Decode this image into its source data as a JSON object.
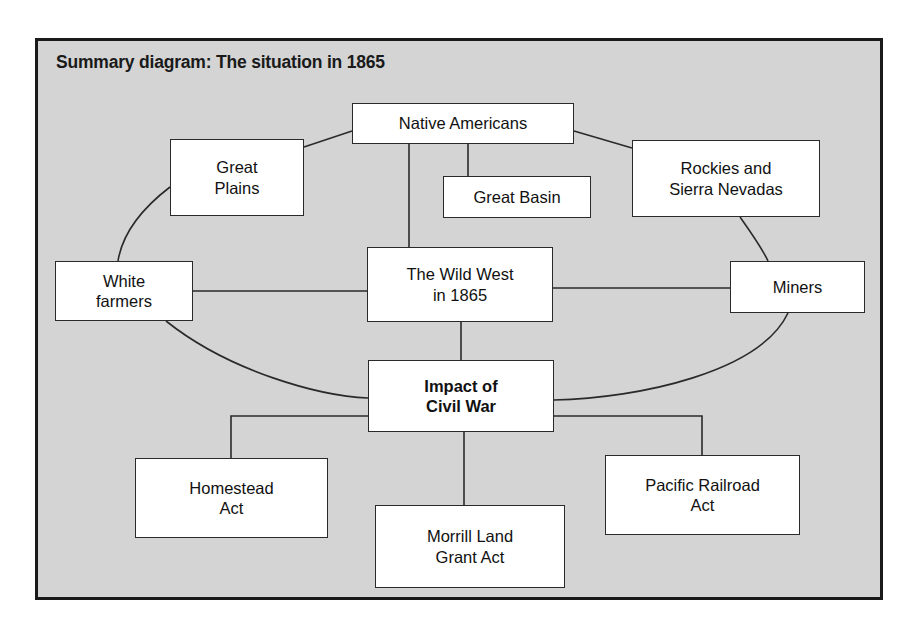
{
  "diagram": {
    "title": "Summary diagram: The situation in 1865",
    "type": "concept-map",
    "frame": {
      "background_color": "#d4d4d4",
      "border_color": "#1a1a1a",
      "page_background": "#ffffff"
    },
    "node_style": {
      "fill": "#ffffff",
      "stroke": "#2a2a2a",
      "text_color": "#111111"
    },
    "nodes": [
      {
        "id": "native-americans",
        "label": "Native Americans",
        "bold": false,
        "x": 352,
        "y": 103,
        "w": 222,
        "h": 41
      },
      {
        "id": "great-plains",
        "label": "Great\nPlains",
        "bold": false,
        "x": 170,
        "y": 139,
        "w": 134,
        "h": 77
      },
      {
        "id": "great-basin",
        "label": "Great Basin",
        "bold": false,
        "x": 443,
        "y": 176,
        "w": 148,
        "h": 42
      },
      {
        "id": "rockies-sierra-nevadas",
        "label": "Rockies and\nSierra Nevadas",
        "bold": false,
        "x": 632,
        "y": 140,
        "w": 188,
        "h": 77
      },
      {
        "id": "white-farmers",
        "label": "White\nfarmers",
        "bold": false,
        "x": 55,
        "y": 261,
        "w": 138,
        "h": 60
      },
      {
        "id": "wild-west-1865",
        "label": "The Wild West\nin 1865",
        "bold": false,
        "x": 367,
        "y": 247,
        "w": 186,
        "h": 75
      },
      {
        "id": "miners",
        "label": "Miners",
        "bold": false,
        "x": 730,
        "y": 261,
        "w": 135,
        "h": 52
      },
      {
        "id": "impact-of-civil-war",
        "label": "Impact of\nCivil War",
        "bold": true,
        "x": 368,
        "y": 360,
        "w": 186,
        "h": 72
      },
      {
        "id": "homestead-act",
        "label": "Homestead\nAct",
        "bold": false,
        "x": 135,
        "y": 458,
        "w": 193,
        "h": 80
      },
      {
        "id": "morrill-land-grant-act",
        "label": "Morrill Land\nGrant Act",
        "bold": false,
        "x": 375,
        "y": 505,
        "w": 190,
        "h": 83
      },
      {
        "id": "pacific-railroad-act",
        "label": "Pacific Railroad\nAct",
        "bold": false,
        "x": 605,
        "y": 455,
        "w": 195,
        "h": 80
      }
    ],
    "edges": [
      {
        "id": "na-to-great-plains",
        "from": "native-americans",
        "to": "great-plains",
        "style": "straight"
      },
      {
        "id": "na-to-great-basin",
        "from": "native-americans",
        "to": "great-basin",
        "style": "orthogonal"
      },
      {
        "id": "na-to-rockies",
        "from": "native-americans",
        "to": "rockies-sierra-nevadas",
        "style": "straight"
      },
      {
        "id": "na-to-wild-west",
        "from": "native-americans",
        "to": "wild-west-1865",
        "style": "straight"
      },
      {
        "id": "great-plains-to-white-farmers",
        "from": "great-plains",
        "to": "white-farmers",
        "style": "curve"
      },
      {
        "id": "rockies-to-miners",
        "from": "rockies-sierra-nevadas",
        "to": "miners",
        "style": "curve"
      },
      {
        "id": "white-farmers-to-wild-west",
        "from": "white-farmers",
        "to": "wild-west-1865",
        "style": "straight"
      },
      {
        "id": "wild-west-to-miners",
        "from": "wild-west-1865",
        "to": "miners",
        "style": "straight"
      },
      {
        "id": "wild-west-to-impact",
        "from": "wild-west-1865",
        "to": "impact-of-civil-war",
        "style": "straight"
      },
      {
        "id": "white-farmers-to-impact",
        "from": "white-farmers",
        "to": "impact-of-civil-war",
        "style": "curve"
      },
      {
        "id": "miners-to-impact",
        "from": "miners",
        "to": "impact-of-civil-war",
        "style": "curve"
      },
      {
        "id": "impact-to-homestead",
        "from": "impact-of-civil-war",
        "to": "homestead-act",
        "style": "orthogonal"
      },
      {
        "id": "impact-to-morrill",
        "from": "impact-of-civil-war",
        "to": "morrill-land-grant-act",
        "style": "orthogonal"
      },
      {
        "id": "impact-to-pacific",
        "from": "impact-of-civil-war",
        "to": "pacific-railroad-act",
        "style": "orthogonal"
      }
    ]
  }
}
